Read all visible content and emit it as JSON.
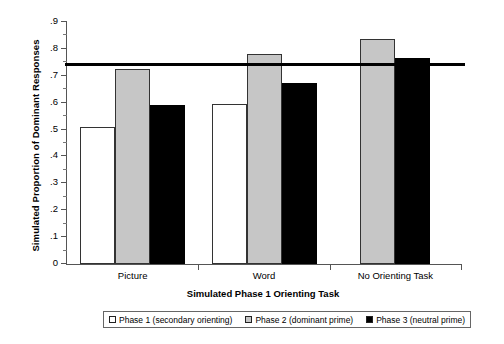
{
  "chart_data": {
    "type": "bar",
    "title": "",
    "xlabel": "Simulated Phase 1 Orienting Task",
    "ylabel": "Simulated Proportion of Dominant Responses",
    "categories": [
      "Picture",
      "Word",
      "No Orienting Task"
    ],
    "ylim": [
      0,
      0.9
    ],
    "ytick_labels": [
      "0",
      ".1",
      ".2",
      ".3",
      ".4",
      ".5",
      ".6",
      ".7",
      ".8",
      ".9"
    ],
    "ytick_values": [
      0,
      0.1,
      0.2,
      0.3,
      0.4,
      0.5,
      0.6,
      0.7,
      0.8,
      0.9
    ],
    "minor_ticks": true,
    "grid": false,
    "legend_position": "bottom",
    "series": [
      {
        "name": "Phase 1 (secondary orienting)",
        "color": "#ffffff",
        "values": [
          0.51,
          0.595,
          null
        ]
      },
      {
        "name": "Phase 2 (dominant prime)",
        "color": "#c6c6c6",
        "values": [
          0.725,
          0.78,
          0.835
        ]
      },
      {
        "name": "Phase 3 (neutral prime)",
        "color": "#000000",
        "values": [
          0.59,
          0.672,
          0.765
        ]
      }
    ],
    "annotations": [
      {
        "type": "horizontal-reference-line",
        "value": 0.735,
        "color": "#000000"
      }
    ]
  },
  "axis": {
    "ylabel": "Simulated Proportion of Dominant Responses",
    "xlabel": "Simulated Phase 1 Orienting Task",
    "ytick_0": "0",
    "ytick_1": ".1",
    "ytick_2": ".2",
    "ytick_3": ".3",
    "ytick_4": ".4",
    "ytick_5": ".5",
    "ytick_6": ".6",
    "ytick_7": ".7",
    "ytick_8": ".8",
    "ytick_9": ".9",
    "xtick_0": "Picture",
    "xtick_1": "Word",
    "xtick_2": "No Orienting Task"
  },
  "legend": {
    "items": [
      {
        "label": "Phase 1 (secondary orienting)"
      },
      {
        "label": "Phase 2 (dominant prime)"
      },
      {
        "label": "Phase 3 (neutral prime)"
      }
    ]
  }
}
